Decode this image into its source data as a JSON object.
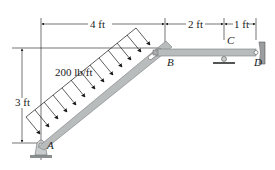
{
  "figure": {
    "type": "statics-frame-diagram",
    "dimensions": {
      "horizontal_A_to_B": "4 ft",
      "horizontal_B_to_C": "2 ft",
      "horizontal_C_to_D": "1 ft",
      "vertical_A_to_B": "3 ft"
    },
    "load": {
      "label": "200 lb/ft",
      "type": "distributed",
      "direction": "downward, perpendicular to member AB",
      "arrow_count": 12
    },
    "points": {
      "A": "A",
      "B": "B",
      "C": "C",
      "D": "D"
    },
    "supports": {
      "A": "pin",
      "C": "roller",
      "D": "pin (wall)"
    },
    "colors": {
      "member": "#b9bcbc",
      "member_edge": "#8a8e8e",
      "line": "#1a1a1a",
      "background": "#ffffff"
    }
  }
}
